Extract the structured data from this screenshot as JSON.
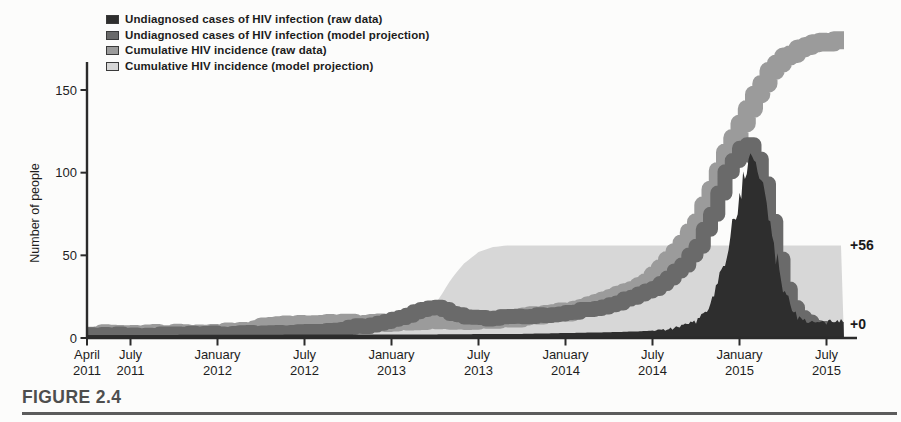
{
  "figure_label": "FIGURE 2.4",
  "colors": {
    "background": "#fcfcfb",
    "axis": "#2b2b2b",
    "text": "#1e1e1e",
    "rule": "#5c5c5c",
    "undiagnosed_raw": "#2e2e2e",
    "undiagnosed_projection": "#6a6a6a",
    "cumulative_raw": "#9b9b9b",
    "cumulative_projection": "#d7d7d7"
  },
  "chart_data": {
    "type": "area",
    "title": "",
    "xlabel": "",
    "ylabel": "Number of people",
    "ylim": [
      0,
      150
    ],
    "y_ticks": [
      0,
      50,
      100,
      150
    ],
    "grid": false,
    "legend_position": "top-left",
    "x_unit": "months since April 2011",
    "x_end_month": 52.2,
    "x_ticks": [
      {
        "m": 0,
        "month": "April",
        "year": "2011"
      },
      {
        "m": 3,
        "month": "July",
        "year": "2011"
      },
      {
        "m": 9,
        "month": "January",
        "year": "2012"
      },
      {
        "m": 15,
        "month": "July",
        "year": "2012"
      },
      {
        "m": 21,
        "month": "January",
        "year": "2013"
      },
      {
        "m": 27,
        "month": "July",
        "year": "2013"
      },
      {
        "m": 33,
        "month": "January",
        "year": "2014"
      },
      {
        "m": 39,
        "month": "July",
        "year": "2014"
      },
      {
        "m": 45,
        "month": "January",
        "year": "2015"
      },
      {
        "m": 51,
        "month": "July",
        "year": "2015"
      }
    ],
    "annotations": [
      {
        "text": "+56",
        "at_value": 56
      },
      {
        "text": "+0",
        "at_value": 8.5
      }
    ],
    "series": [
      {
        "name": "Undiagnosed cases of HIV infection (raw data)",
        "style": "filled-jagged-area",
        "color": "#2e2e2e",
        "points": [
          [
            0,
            1.8
          ],
          [
            12,
            2
          ],
          [
            24,
            2.2
          ],
          [
            30,
            2.5
          ],
          [
            33,
            3
          ],
          [
            36,
            3.5
          ],
          [
            38,
            4
          ],
          [
            40,
            5
          ],
          [
            41,
            7
          ],
          [
            42,
            10
          ],
          [
            43,
            20
          ],
          [
            44,
            48
          ],
          [
            45,
            85
          ],
          [
            45.4,
            100
          ],
          [
            45.8,
            108
          ],
          [
            46.2,
            103
          ],
          [
            46.6,
            93
          ],
          [
            47,
            72
          ],
          [
            47.5,
            50
          ],
          [
            48,
            32
          ],
          [
            48.5,
            20
          ],
          [
            49,
            13
          ],
          [
            49.5,
            11
          ],
          [
            50,
            9.5
          ],
          [
            51,
            9
          ],
          [
            51.5,
            10
          ],
          [
            52.2,
            11
          ]
        ]
      },
      {
        "name": "Undiagnosed cases of HIV infection (model projection)",
        "style": "thick-band",
        "color": "#6a6a6a",
        "points": [
          [
            0,
            1.5
          ],
          [
            6,
            2
          ],
          [
            9,
            2.5
          ],
          [
            12,
            3
          ],
          [
            15,
            4
          ],
          [
            18,
            6
          ],
          [
            20,
            9
          ],
          [
            21,
            11
          ],
          [
            22,
            14
          ],
          [
            23,
            17
          ],
          [
            24,
            18.5
          ],
          [
            25,
            15
          ],
          [
            26,
            13
          ],
          [
            27,
            12
          ],
          [
            29,
            12.5
          ],
          [
            31,
            13.5
          ],
          [
            33,
            15
          ],
          [
            34,
            16.5
          ],
          [
            35,
            18
          ],
          [
            36,
            20
          ],
          [
            37,
            23
          ],
          [
            38,
            26
          ],
          [
            39,
            30
          ],
          [
            40,
            36
          ],
          [
            41,
            44
          ],
          [
            42,
            56
          ],
          [
            43,
            75
          ],
          [
            44,
            100
          ],
          [
            45,
            115
          ],
          [
            45.6,
            118
          ],
          [
            46,
            108
          ],
          [
            46.5,
            93
          ],
          [
            47,
            70
          ],
          [
            47.5,
            48
          ],
          [
            48,
            30
          ],
          [
            48.5,
            19
          ],
          [
            49,
            12
          ],
          [
            50,
            6
          ],
          [
            51,
            4.5
          ],
          [
            52.2,
            4.5
          ]
        ]
      },
      {
        "name": "Cumulative HIV incidence (raw data)",
        "style": "thick-step-band",
        "color": "#9b9b9b",
        "points": [
          [
            0,
            2
          ],
          [
            3,
            2.5
          ],
          [
            9,
            3
          ],
          [
            11,
            4
          ],
          [
            12,
            7.5
          ],
          [
            15,
            8
          ],
          [
            19,
            9
          ],
          [
            21,
            10
          ],
          [
            24,
            10.5
          ],
          [
            27,
            11
          ],
          [
            29,
            12
          ],
          [
            31,
            13.5
          ],
          [
            33,
            16
          ],
          [
            34,
            18
          ],
          [
            35,
            20.5
          ],
          [
            36,
            24
          ],
          [
            37,
            27
          ],
          [
            38,
            31
          ],
          [
            39,
            38
          ],
          [
            40,
            47
          ],
          [
            41,
            57
          ],
          [
            42,
            70
          ],
          [
            43,
            90
          ],
          [
            44,
            112
          ],
          [
            45,
            130
          ],
          [
            46,
            148
          ],
          [
            47,
            161
          ],
          [
            48,
            170
          ],
          [
            49,
            175
          ],
          [
            50,
            178
          ],
          [
            51,
            179
          ],
          [
            52.2,
            180
          ]
        ]
      },
      {
        "name": "Cumulative HIV incidence (model projection)",
        "style": "filled-area",
        "color": "#d7d7d7",
        "points": [
          [
            0,
            1
          ],
          [
            6,
            1.5
          ],
          [
            9,
            2
          ],
          [
            12,
            2.5
          ],
          [
            15,
            3
          ],
          [
            18,
            4.5
          ],
          [
            20,
            5.5
          ],
          [
            21,
            6.5
          ],
          [
            22,
            8
          ],
          [
            23,
            11
          ],
          [
            23.5,
            14.5
          ],
          [
            24,
            20
          ],
          [
            24.5,
            27
          ],
          [
            25,
            34
          ],
          [
            25.5,
            40
          ],
          [
            26,
            45
          ],
          [
            27,
            52
          ],
          [
            28,
            55
          ],
          [
            29,
            56
          ],
          [
            52.2,
            56
          ]
        ]
      }
    ]
  }
}
